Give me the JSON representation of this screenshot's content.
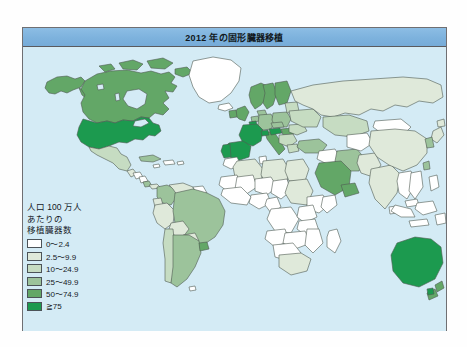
{
  "figure": {
    "title": "2012 年の固形臓器移植",
    "title_bar_color": "#7db2dd",
    "ocean_color": "#d4ebf5",
    "frame_color": "#6f6f72",
    "country_border_color": "#4f5a52"
  },
  "legend": {
    "heading_lines": [
      "人口 100 万人",
      "あたりの",
      "移植臓器数"
    ],
    "items": [
      {
        "label": "0〜2.4",
        "color": "#ffffff",
        "min": 0,
        "max": 2.4
      },
      {
        "label": "2.5〜9.9",
        "color": "#dfe9da",
        "min": 2.5,
        "max": 9.9
      },
      {
        "label": "10〜24.9",
        "color": "#c6dcc2",
        "min": 10,
        "max": 24.9
      },
      {
        "label": "25〜49.9",
        "color": "#9cc39b",
        "min": 25,
        "max": 49.9
      },
      {
        "label": "50〜74.9",
        "color": "#63a767",
        "min": 50,
        "max": 74.9
      },
      {
        "label": "≧75",
        "color": "#1c9a4f",
        "min": 75,
        "max": null
      }
    ]
  },
  "chart_data": {
    "type": "heatmap",
    "title": "2012 年の固形臓器移植",
    "subtitle": "",
    "xlabel": "",
    "ylabel": "",
    "value_unit": "人口 100 万人あたりの移植臓器数",
    "legend_position": "left-bottom",
    "grid": false,
    "bins": [
      {
        "label": "0〜2.4",
        "color": "#ffffff"
      },
      {
        "label": "2.5〜9.9",
        "color": "#dfe9da"
      },
      {
        "label": "10〜24.9",
        "color": "#c6dcc2"
      },
      {
        "label": "25〜49.9",
        "color": "#9cc39b"
      },
      {
        "label": "50〜74.9",
        "color": "#63a767"
      },
      {
        "label": "≧75",
        "color": "#1c9a4f"
      }
    ],
    "regions": [
      {
        "name": "United States",
        "bin": "≧75",
        "color": "#1c9a4f"
      },
      {
        "name": "Canada",
        "bin": "50〜74.9",
        "color": "#63a767"
      },
      {
        "name": "Greenland",
        "bin": "0〜2.4",
        "color": "#ffffff"
      },
      {
        "name": "Mexico",
        "bin": "10〜24.9",
        "color": "#c6dcc2"
      },
      {
        "name": "Cuba",
        "bin": "25〜49.9",
        "color": "#9cc39b"
      },
      {
        "name": "Brazil",
        "bin": "25〜49.9",
        "color": "#9cc39b"
      },
      {
        "name": "Argentina",
        "bin": "25〜49.9",
        "color": "#9cc39b"
      },
      {
        "name": "Uruguay",
        "bin": "50〜74.9",
        "color": "#63a767"
      },
      {
        "name": "Chile",
        "bin": "10〜24.9",
        "color": "#c6dcc2"
      },
      {
        "name": "Colombia",
        "bin": "25〜49.9",
        "color": "#9cc39b"
      },
      {
        "name": "Venezuela",
        "bin": "2.5〜9.9",
        "color": "#dfe9da"
      },
      {
        "name": "Peru",
        "bin": "2.5〜9.9",
        "color": "#dfe9da"
      },
      {
        "name": "Bolivia",
        "bin": "2.5〜9.9",
        "color": "#dfe9da"
      },
      {
        "name": "Spain",
        "bin": "≧75",
        "color": "#1c9a4f"
      },
      {
        "name": "France",
        "bin": "≧75",
        "color": "#1c9a4f"
      },
      {
        "name": "Portugal",
        "bin": "≧75",
        "color": "#1c9a4f"
      },
      {
        "name": "Norway",
        "bin": "50〜74.9",
        "color": "#63a767"
      },
      {
        "name": "Sweden",
        "bin": "50〜74.9",
        "color": "#63a767"
      },
      {
        "name": "Finland",
        "bin": "50〜74.9",
        "color": "#63a767"
      },
      {
        "name": "United Kingdom",
        "bin": "50〜74.9",
        "color": "#63a767"
      },
      {
        "name": "Ireland",
        "bin": "50〜74.9",
        "color": "#63a767"
      },
      {
        "name": "Germany",
        "bin": "25〜49.9",
        "color": "#9cc39b"
      },
      {
        "name": "Italy",
        "bin": "50〜74.9",
        "color": "#63a767"
      },
      {
        "name": "Austria",
        "bin": "≧75",
        "color": "#1c9a4f"
      },
      {
        "name": "Poland",
        "bin": "25〜49.9",
        "color": "#9cc39b"
      },
      {
        "name": "Turkey",
        "bin": "25〜49.9",
        "color": "#9cc39b"
      },
      {
        "name": "Russia",
        "bin": "2.5〜9.9",
        "color": "#dfe9da"
      },
      {
        "name": "Kazakhstan",
        "bin": "10〜24.9",
        "color": "#c6dcc2"
      },
      {
        "name": "China",
        "bin": "2.5〜9.9",
        "color": "#dfe9da"
      },
      {
        "name": "India",
        "bin": "2.5〜9.9",
        "color": "#dfe9da"
      },
      {
        "name": "Iran",
        "bin": "25〜49.9",
        "color": "#9cc39b"
      },
      {
        "name": "Saudi Arabia",
        "bin": "25〜49.9",
        "color": "#9cc39b"
      },
      {
        "name": "Japan",
        "bin": "2.5〜9.9",
        "color": "#dfe9da"
      },
      {
        "name": "South Korea",
        "bin": "25〜49.9",
        "color": "#9cc39b"
      },
      {
        "name": "Australia",
        "bin": "≧75",
        "color": "#1c9a4f"
      },
      {
        "name": "New Zealand",
        "bin": "50〜74.9",
        "color": "#63a767"
      },
      {
        "name": "South Africa",
        "bin": "2.5〜9.9",
        "color": "#dfe9da"
      },
      {
        "name": "Egypt",
        "bin": "2.5〜9.9",
        "color": "#dfe9da"
      },
      {
        "name": "Libya",
        "bin": "2.5〜9.9",
        "color": "#dfe9da"
      },
      {
        "name": "Algeria",
        "bin": "2.5〜9.9",
        "color": "#dfe9da"
      },
      {
        "name": "Sudan",
        "bin": "2.5〜9.9",
        "color": "#dfe9da"
      },
      {
        "name": "Central Africa",
        "bin": "0〜2.4",
        "color": "#ffffff"
      },
      {
        "name": "Indonesia",
        "bin": "0〜2.4",
        "color": "#ffffff"
      },
      {
        "name": "Papua New Guinea",
        "bin": "0〜2.4",
        "color": "#ffffff"
      },
      {
        "name": "Mongolia",
        "bin": "0〜2.4",
        "color": "#ffffff"
      }
    ]
  }
}
